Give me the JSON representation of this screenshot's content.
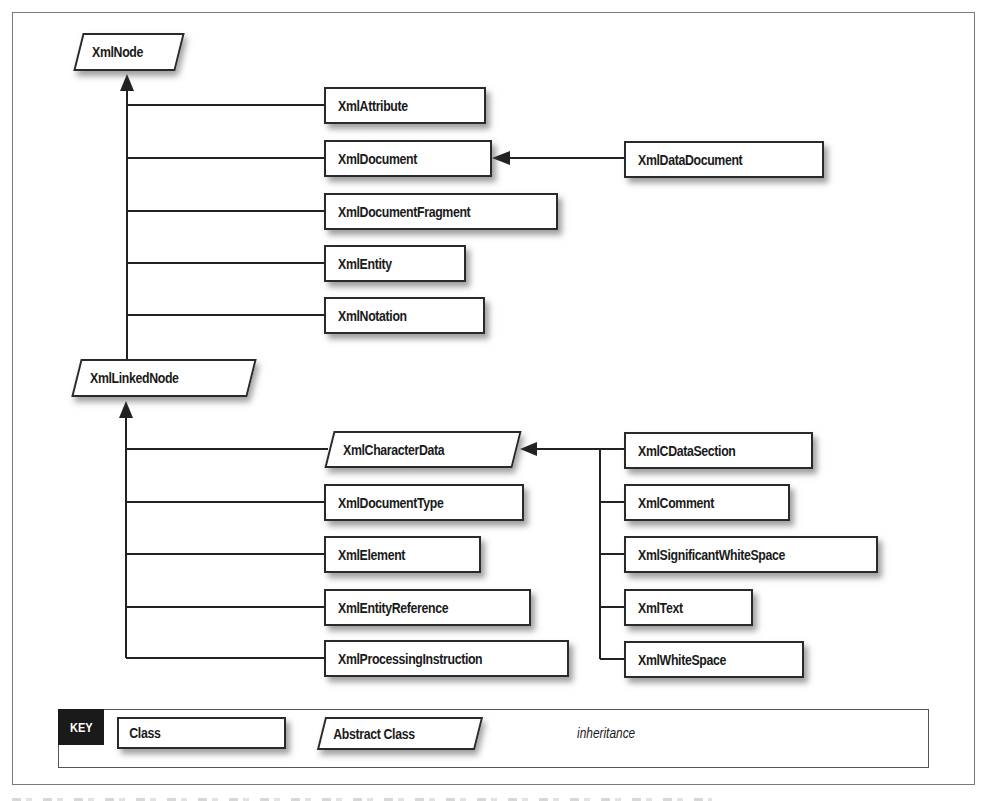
{
  "diagram": {
    "type": "class-hierarchy",
    "nodes": {
      "xmlnode": {
        "label": "XmlNode",
        "kind": "abstract"
      },
      "xmlattribute": {
        "label": "XmlAttribute",
        "kind": "class"
      },
      "xmldocument": {
        "label": "XmlDocument",
        "kind": "class"
      },
      "xmldatadocument": {
        "label": "XmlDataDocument",
        "kind": "class"
      },
      "xmldocumentfragment": {
        "label": "XmlDocumentFragment",
        "kind": "class"
      },
      "xmlentity": {
        "label": "XmlEntity",
        "kind": "class"
      },
      "xmlnotation": {
        "label": "XmlNotation",
        "kind": "class"
      },
      "xmllinkednode": {
        "label": "XmlLinkedNode",
        "kind": "abstract"
      },
      "xmlcharacterdata": {
        "label": "XmlCharacterData",
        "kind": "abstract"
      },
      "xmldocumenttype": {
        "label": "XmlDocumentType",
        "kind": "class"
      },
      "xmlelement": {
        "label": "XmlElement",
        "kind": "class"
      },
      "xmlentityreference": {
        "label": "XmlEntityReference",
        "kind": "class"
      },
      "xmlprocessinginstruction": {
        "label": "XmlProcessingInstruction",
        "kind": "class"
      },
      "xmlcdatasection": {
        "label": "XmlCDataSection",
        "kind": "class"
      },
      "xmlcomment": {
        "label": "XmlComment",
        "kind": "class"
      },
      "xmlsignificantwhitespace": {
        "label": "XmlSignificantWhiteSpace",
        "kind": "class"
      },
      "xmltext": {
        "label": "XmlText",
        "kind": "class"
      },
      "xmlwhitespace": {
        "label": "XmlWhiteSpace",
        "kind": "class"
      }
    },
    "edges": [
      {
        "from": "XmlAttribute",
        "to": "XmlNode",
        "type": "inheritance"
      },
      {
        "from": "XmlDocument",
        "to": "XmlNode",
        "type": "inheritance"
      },
      {
        "from": "XmlDocumentFragment",
        "to": "XmlNode",
        "type": "inheritance"
      },
      {
        "from": "XmlEntity",
        "to": "XmlNode",
        "type": "inheritance"
      },
      {
        "from": "XmlNotation",
        "to": "XmlNode",
        "type": "inheritance"
      },
      {
        "from": "XmlLinkedNode",
        "to": "XmlNode",
        "type": "inheritance"
      },
      {
        "from": "XmlDataDocument",
        "to": "XmlDocument",
        "type": "inheritance"
      },
      {
        "from": "XmlCharacterData",
        "to": "XmlLinkedNode",
        "type": "inheritance"
      },
      {
        "from": "XmlDocumentType",
        "to": "XmlLinkedNode",
        "type": "inheritance"
      },
      {
        "from": "XmlElement",
        "to": "XmlLinkedNode",
        "type": "inheritance"
      },
      {
        "from": "XmlEntityReference",
        "to": "XmlLinkedNode",
        "type": "inheritance"
      },
      {
        "from": "XmlProcessingInstruction",
        "to": "XmlLinkedNode",
        "type": "inheritance"
      },
      {
        "from": "XmlCDataSection",
        "to": "XmlCharacterData",
        "type": "inheritance"
      },
      {
        "from": "XmlComment",
        "to": "XmlCharacterData",
        "type": "inheritance"
      },
      {
        "from": "XmlSignificantWhiteSpace",
        "to": "XmlCharacterData",
        "type": "inheritance"
      },
      {
        "from": "XmlText",
        "to": "XmlCharacterData",
        "type": "inheritance"
      },
      {
        "from": "XmlWhiteSpace",
        "to": "XmlCharacterData",
        "type": "inheritance"
      }
    ]
  },
  "key": {
    "badge": "KEY",
    "class_label": "Class",
    "abstract_label": "Abstract Class",
    "arrow_label": "inheritance"
  },
  "colors": {
    "line": "#222222",
    "box_border": "#2a2a2a",
    "shadow": "#8a8a8a",
    "key_badge_bg": "#1a1a1a",
    "frame": "#7a7a7a"
  }
}
